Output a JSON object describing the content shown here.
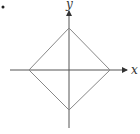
{
  "diagram": {
    "type": "coordinate-plot",
    "axes": {
      "x_label": "x",
      "y_label": "y",
      "origin": [
        69,
        70
      ],
      "x_axis": {
        "from": [
          10,
          70
        ],
        "to": [
          128,
          70
        ]
      },
      "y_axis": {
        "from": [
          69,
          128
        ],
        "to": [
          69,
          10
        ]
      }
    },
    "shape": {
      "name": "diamond",
      "vertices": [
        [
          69,
          28
        ],
        [
          110,
          70
        ],
        [
          69,
          110
        ],
        [
          29,
          70
        ]
      ]
    },
    "colors": {
      "axis": "#555555",
      "shape": "#888888",
      "label": "#333333"
    },
    "marker_dot": [
      3,
      7
    ]
  }
}
